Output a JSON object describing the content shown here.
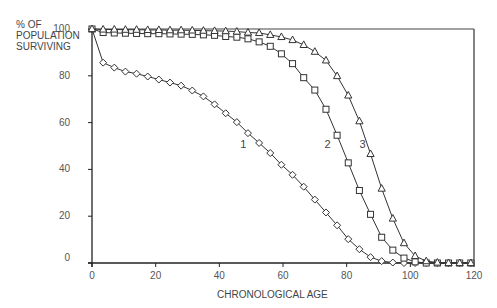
{
  "chart_data": {
    "type": "line",
    "title": "",
    "xlabel": "CHRONOLOGICAL AGE",
    "ylabel": "% OF POPULATION SURVIVING",
    "xlim": [
      0,
      120
    ],
    "ylim": [
      0,
      100
    ],
    "x_ticks": [
      0,
      20,
      40,
      60,
      80,
      100,
      120
    ],
    "y_ticks": [
      0,
      20,
      40,
      60,
      80,
      100
    ],
    "grid": false,
    "legend": "inline curve labels",
    "series": [
      {
        "name": "1",
        "marker": "diamond",
        "x": [
          0,
          3.5,
          7,
          10.5,
          14,
          17.5,
          21,
          24.5,
          28,
          31.5,
          35,
          38.5,
          42,
          45.5,
          49,
          52.5,
          56,
          59.5,
          63,
          66.5,
          70,
          73.5,
          77,
          80.5,
          84,
          87.5,
          91,
          94.5,
          98,
          101.5,
          105,
          108.5,
          112,
          115.5,
          119
        ],
        "values": [
          100,
          85.6,
          83.5,
          81.8,
          80.9,
          79.7,
          78.4,
          77.1,
          75.8,
          73.7,
          71.2,
          67.8,
          64,
          60.2,
          55.5,
          51.3,
          47,
          42,
          37.7,
          32.6,
          27.1,
          21.6,
          16.1,
          10.2,
          5.9,
          2.5,
          0.8,
          0.2,
          0,
          0,
          0,
          0,
          0,
          0,
          0
        ]
      },
      {
        "name": "2",
        "marker": "square",
        "x": [
          0,
          3.5,
          7,
          10.5,
          14,
          17.5,
          21,
          24.5,
          28,
          31.5,
          35,
          38.5,
          42,
          45.5,
          49,
          52.5,
          56,
          59.5,
          63,
          66.5,
          70,
          73.5,
          77,
          80.5,
          84,
          87.5,
          91,
          94.5,
          98,
          101.5,
          105,
          108.5,
          112,
          115.5,
          119
        ],
        "values": [
          100,
          98.5,
          98.3,
          98.2,
          98.1,
          98,
          98,
          97.9,
          97.8,
          97.7,
          97.5,
          97.3,
          96.8,
          96.5,
          95.8,
          94.5,
          92.6,
          89.4,
          85.2,
          79.2,
          73.9,
          65.7,
          54.6,
          42.8,
          31,
          20.8,
          11,
          5.5,
          2.1,
          0.5,
          0,
          0,
          0,
          0,
          0
        ]
      },
      {
        "name": "3",
        "marker": "triangle",
        "x": [
          0,
          3.5,
          7,
          10.5,
          14,
          17.5,
          21,
          24.5,
          28,
          31.5,
          35,
          38.5,
          42,
          45.5,
          49,
          52.5,
          56,
          59.5,
          63,
          66.5,
          70,
          73.5,
          77,
          80.5,
          84,
          87.5,
          91,
          94.5,
          98,
          101.5,
          105,
          108.5,
          112,
          115.5,
          119
        ],
        "values": [
          100,
          99.8,
          99.8,
          99.7,
          99.7,
          99.6,
          99.6,
          99.5,
          99.5,
          99.4,
          99.3,
          99.2,
          99.1,
          98.9,
          98.5,
          98.3,
          97.5,
          96.6,
          95.3,
          93.2,
          90.3,
          86.6,
          79.9,
          71.6,
          60.6,
          46.6,
          31.8,
          19,
          8.5,
          3,
          0.8,
          0.2,
          0,
          0,
          0
        ]
      }
    ],
    "annotations": [
      {
        "text": "1",
        "x": 47.5,
        "y": 51
      },
      {
        "text": "2",
        "x": 74,
        "y": 51
      },
      {
        "text": "3",
        "x": 85,
        "y": 51
      }
    ]
  },
  "axes": {
    "ylabel_lines": [
      "% OF",
      "POPULATION",
      "SURVIVING"
    ],
    "xlabel": "CHRONOLOGICAL AGE",
    "x_tick_labels": [
      "0",
      "20",
      "40",
      "60",
      "80",
      "100",
      "120"
    ],
    "y_tick_labels": [
      "0",
      "20",
      "40",
      "60",
      "80",
      "100"
    ]
  }
}
